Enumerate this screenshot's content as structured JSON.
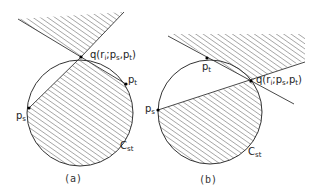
{
  "figures": [
    {
      "id": "a",
      "caption": "(a)",
      "labels": {
        "q": "q(r",
        "q_sub": "i",
        "q_rest": ";p",
        "q_sub2": "s",
        "q_rest2": ",p",
        "q_sub3": "t",
        "q_close": ")",
        "pt": "p",
        "pt_sub": "t",
        "ps": "p",
        "ps_sub": "s",
        "cst": "C",
        "cst_sub": "st"
      }
    },
    {
      "id": "b",
      "caption": "(b)",
      "labels": {
        "q": "q(r",
        "q_sub": "i",
        "q_rest": ";p",
        "q_sub2": "s",
        "q_rest2": ",p",
        "q_sub3": "t",
        "q_close": ")",
        "pt": "p",
        "pt_sub": "t",
        "ps": "p",
        "ps_sub": "s",
        "cst": "C",
        "cst_sub": "st"
      }
    }
  ],
  "colors": {
    "stroke": "#333333",
    "hatch": "#444444",
    "background": "#ffffff"
  }
}
